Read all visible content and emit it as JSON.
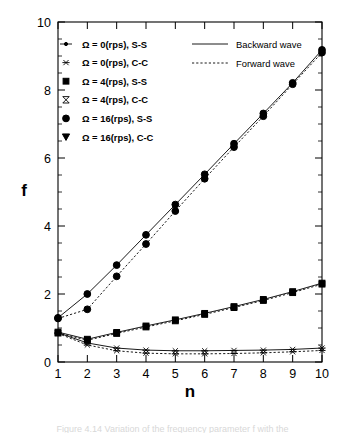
{
  "figure": {
    "caption": "Figure 4.14  Variation of the frequency parameter f with the"
  },
  "axes": {
    "ylabel": "f",
    "xlabel": "n",
    "y_ticks": [
      "0",
      "2",
      "4",
      "6",
      "8",
      "10"
    ],
    "x_ticks": [
      "1",
      "2",
      "3",
      "4",
      "5",
      "6",
      "7",
      "8",
      "9",
      "10"
    ]
  },
  "legend_left": [
    {
      "marker": "dot-with-line-icon",
      "label": "Ω = 0(rps),  S-S"
    },
    {
      "marker": "asterisk-icon",
      "label": "Ω = 0(rps),  C-C"
    },
    {
      "marker": "filled-square-icon",
      "label": "Ω = 4(rps),  S-S"
    },
    {
      "marker": "bowtie-icon",
      "label": "Ω = 4(rps),  C-C"
    },
    {
      "marker": "filled-circle-icon",
      "label": "Ω = 16(rps),  S-S"
    },
    {
      "marker": "filled-triangle-down-icon",
      "label": "Ω = 16(rps),  C-C"
    }
  ],
  "legend_right": [
    {
      "style": "solid-line-icon",
      "label": "Backward wave"
    },
    {
      "style": "dashed-line-icon",
      "label": "Forward wave"
    }
  ],
  "chart_data": {
    "type": "line",
    "title": "",
    "xlabel": "n",
    "ylabel": "f",
    "xlim": [
      1,
      10
    ],
    "ylim": [
      0,
      10
    ],
    "grid": false,
    "legend_position": "top-inside",
    "x": [
      1,
      2,
      3,
      4,
      5,
      6,
      7,
      8,
      9,
      10
    ],
    "series": [
      {
        "name": "Ω = 16(rps),  S-S  (Backward wave)",
        "marker": "filled-circle-icon",
        "line": "solid",
        "values": [
          1.3,
          2.0,
          2.85,
          3.74,
          4.63,
          5.52,
          6.42,
          7.31,
          8.21,
          9.18
        ]
      },
      {
        "name": "Ω = 16(rps),  S-S  (Forward wave)",
        "marker": "filled-circle-icon",
        "line": "dashed",
        "values": [
          1.28,
          1.55,
          2.52,
          3.47,
          4.44,
          5.39,
          6.32,
          7.23,
          8.17,
          9.1
        ]
      },
      {
        "name": "Ω = 4(rps),  S-S  (Backward wave)",
        "marker": "filled-square-icon",
        "line": "solid",
        "values": [
          0.88,
          0.67,
          0.87,
          1.06,
          1.24,
          1.43,
          1.63,
          1.84,
          2.07,
          2.32
        ]
      },
      {
        "name": "Ω = 4(rps),  S-S  (Forward wave)",
        "marker": "filled-square-icon",
        "line": "dashed",
        "values": [
          0.85,
          0.64,
          0.84,
          1.03,
          1.21,
          1.4,
          1.6,
          1.81,
          2.04,
          2.29
        ]
      },
      {
        "name": "Ω = 0(rps),  C-C  (Backward wave)",
        "marker": "asterisk-icon",
        "line": "solid",
        "values": [
          0.86,
          0.56,
          0.41,
          0.35,
          0.33,
          0.33,
          0.34,
          0.35,
          0.37,
          0.41
        ]
      },
      {
        "name": "Ω = 0(rps),  C-C  (Forward wave)",
        "marker": "asterisk-icon",
        "line": "dashed",
        "values": [
          0.84,
          0.5,
          0.33,
          0.26,
          0.24,
          0.24,
          0.25,
          0.27,
          0.3,
          0.34
        ]
      }
    ]
  }
}
